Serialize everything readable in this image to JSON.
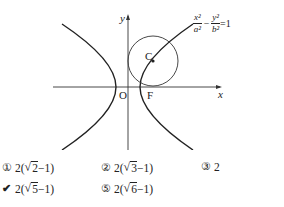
{
  "figure": {
    "equation": {
      "x_num": "x²",
      "x_den": "a²",
      "minus": "−",
      "y_num": "y²",
      "y_den": "b²",
      "rhs": "=1"
    },
    "labels": {
      "y_axis": "y",
      "x_axis": "x",
      "origin": "O",
      "focus": "F",
      "center": "C"
    }
  },
  "choices": [
    {
      "marker": "①",
      "prefix": "2(",
      "radicand": "2",
      "suffix": "−1)",
      "selected": false
    },
    {
      "marker": "②",
      "prefix": "2(",
      "radicand": "3",
      "suffix": "−1)",
      "selected": false
    },
    {
      "marker": "③",
      "text": "2",
      "selected": false
    },
    {
      "marker": "✔",
      "prefix": "2(",
      "radicand": "5",
      "suffix": "−1)",
      "selected": true
    },
    {
      "marker": "⑤",
      "prefix": "2(",
      "radicand": "6",
      "suffix": "−1)",
      "selected": false
    }
  ]
}
